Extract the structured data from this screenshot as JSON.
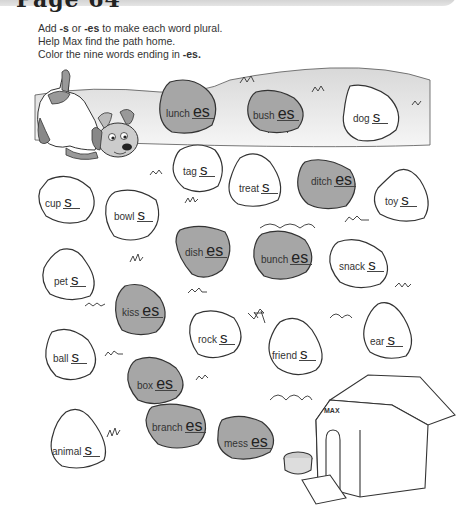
{
  "page": {
    "title": "Page 64",
    "instructions": [
      {
        "prefix": "Add ",
        "bold1": "-s",
        "mid": " or ",
        "bold2": "-es",
        "suffix": " to make each word plural."
      },
      {
        "text": "Help Max find the path home."
      },
      {
        "prefix": "Color the nine words ending in ",
        "bold": "-es."
      }
    ]
  },
  "doghouse": {
    "sign": "MAX"
  },
  "colors": {
    "shaded_stone": "#a6a6a6",
    "hill": "#e2e2e2",
    "outline": "#333333"
  },
  "stones": [
    {
      "word": "lunch",
      "suffix": "es",
      "shaded": true
    },
    {
      "word": "bush",
      "suffix": "es",
      "shaded": true
    },
    {
      "word": "dog",
      "suffix": "s",
      "shaded": false
    },
    {
      "word": "tag",
      "suffix": "s",
      "shaded": false
    },
    {
      "word": "treat",
      "suffix": "s",
      "shaded": false
    },
    {
      "word": "ditch",
      "suffix": "es",
      "shaded": true
    },
    {
      "word": "toy",
      "suffix": "s",
      "shaded": false
    },
    {
      "word": "cup",
      "suffix": "s",
      "shaded": false
    },
    {
      "word": "bowl",
      "suffix": "s",
      "shaded": false
    },
    {
      "word": "dish",
      "suffix": "es",
      "shaded": true
    },
    {
      "word": "bunch",
      "suffix": "es",
      "shaded": true
    },
    {
      "word": "snack",
      "suffix": "s",
      "shaded": false
    },
    {
      "word": "pet",
      "suffix": "s",
      "shaded": false
    },
    {
      "word": "kiss",
      "suffix": "es",
      "shaded": true
    },
    {
      "word": "rock",
      "suffix": "s",
      "shaded": false
    },
    {
      "word": "friend",
      "suffix": "s",
      "shaded": false
    },
    {
      "word": "ear",
      "suffix": "s",
      "shaded": false
    },
    {
      "word": "ball",
      "suffix": "s",
      "shaded": false
    },
    {
      "word": "box",
      "suffix": "es",
      "shaded": true
    },
    {
      "word": "branch",
      "suffix": "es",
      "shaded": true
    },
    {
      "word": "mess",
      "suffix": "es",
      "shaded": true
    },
    {
      "word": "animal",
      "suffix": "s",
      "shaded": false
    }
  ]
}
